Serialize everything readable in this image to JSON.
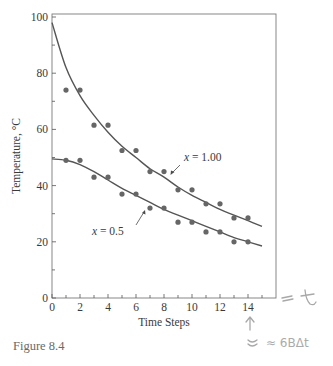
{
  "figure": {
    "caption": "Figure 8.4",
    "handwriting": {
      "axis_end_note": "= t",
      "arrow_note": "↑",
      "below_note": "≈ 6BΔt"
    }
  },
  "chart_data": {
    "type": "line",
    "title": "",
    "xlabel": "Time Steps",
    "ylabel": "Temperature, °C",
    "xlim": [
      0,
      16
    ],
    "ylim": [
      0,
      100
    ],
    "x_ticks": [
      0,
      2,
      4,
      6,
      8,
      10,
      12,
      14
    ],
    "x_minor_ticks": [
      1,
      3,
      5,
      7,
      9,
      11,
      13,
      15
    ],
    "y_ticks": [
      0,
      20,
      40,
      60,
      80,
      100
    ],
    "y_minor_ticks": [
      10,
      30,
      50,
      70,
      90
    ],
    "grid": false,
    "legend": "none (inline annotations)",
    "annotations": [
      {
        "text": "x = 1.00",
        "points_to": "upper curve near step 8.5"
      },
      {
        "text": "x = 0.5",
        "points_to": "lower curve near step 6.5"
      }
    ],
    "series": [
      {
        "name": "x = 1.00 (discrete steps)",
        "kind": "scatter",
        "x": [
          1,
          2,
          3,
          4,
          5,
          6,
          7,
          8,
          9,
          10,
          11,
          12,
          13,
          14
        ],
        "values": [
          74,
          74,
          61.5,
          61.5,
          52.5,
          52.5,
          45,
          45,
          38.5,
          38.5,
          33.5,
          33.5,
          28.5,
          28.5
        ]
      },
      {
        "name": "x = 1.00 (analytic curve)",
        "kind": "line",
        "x": [
          0,
          1,
          2,
          3,
          4,
          5,
          6,
          7,
          8,
          9,
          10,
          11,
          12,
          13,
          14,
          15
        ],
        "values": [
          98,
          82,
          72,
          65,
          59,
          54,
          50,
          46,
          43,
          39.5,
          36.5,
          34,
          31.5,
          29.5,
          27.5,
          25.5
        ]
      },
      {
        "name": "x = 0.5 (discrete steps)",
        "kind": "scatter",
        "x": [
          1,
          2,
          3,
          4,
          5,
          6,
          7,
          8,
          9,
          10,
          11,
          12,
          13,
          14
        ],
        "values": [
          49,
          49,
          43,
          43,
          37,
          37,
          32,
          32,
          27,
          27,
          23.5,
          23.5,
          20,
          20
        ]
      },
      {
        "name": "x = 0.5 (analytic curve)",
        "kind": "line",
        "x": [
          0,
          1,
          2,
          3,
          4,
          5,
          6,
          7,
          8,
          9,
          10,
          11,
          12,
          13,
          14,
          15
        ],
        "values": [
          49.5,
          49,
          47.5,
          45,
          42,
          39,
          36.5,
          34,
          31.5,
          29.5,
          27.5,
          25.5,
          23.5,
          21.5,
          20,
          18.5
        ]
      }
    ]
  }
}
